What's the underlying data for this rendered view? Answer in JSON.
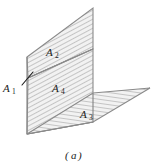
{
  "figure": {
    "caption": "(a)",
    "caption_open_paren": "(",
    "caption_letter": "a",
    "caption_close_paren": ")",
    "background_color": "#ffffff",
    "outline_color": "#8a8a8a",
    "fill_color": "#f0f0f0",
    "hatch_color": "#b4b4b4",
    "label_color": "#1a1a1a",
    "surfaces": [
      {
        "id": "A1",
        "base": "A",
        "subscript": "1",
        "label": "A₁",
        "description": "edge-on surface at left vertical edge",
        "label_x": 4,
        "label_y": 87,
        "hatch": "none"
      },
      {
        "id": "A2",
        "base": "A",
        "subscript": "2",
        "label": "A₂",
        "description": "upper portion of vertical panel",
        "label_x": 47,
        "label_y": 52,
        "hatch": "diagonal-steep"
      },
      {
        "id": "A3",
        "base": "A",
        "subscript": "3",
        "label": "A₃",
        "description": "horizontal floor panel extending to the right",
        "label_x": 81,
        "label_y": 114,
        "hatch": "near-horizontal"
      },
      {
        "id": "A4",
        "base": "A",
        "subscript": "4",
        "label": "A₄",
        "description": "lower portion of vertical panel",
        "label_x": 53,
        "label_y": 88,
        "hatch": "diagonal-steep"
      }
    ],
    "leader_lines": [
      {
        "name": "a1-leader",
        "from_x": 22,
        "from_y": 85,
        "to_x": 33,
        "to_y": 72
      }
    ]
  }
}
